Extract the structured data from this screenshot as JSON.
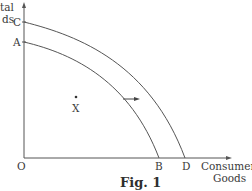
{
  "diagram": {
    "type": "production-possibility-frontier",
    "caption": "Fig. 1",
    "y_axis": {
      "label_line1": "Capital",
      "label_line2": "Goods",
      "visible_line1": "tal",
      "visible_line2": "ds"
    },
    "x_axis": {
      "label_line1": "Consumer",
      "label_line2": "Goods"
    },
    "origin_label": "O",
    "points": {
      "A": "A",
      "B": "B",
      "C": "C",
      "D": "D",
      "X": "X"
    },
    "curves": [
      {
        "name": "AB",
        "from": "A",
        "to": "B",
        "description": "original PPF"
      },
      {
        "name": "CD",
        "from": "C",
        "to": "D",
        "description": "shifted-out PPF"
      }
    ],
    "shift_arrow": {
      "direction": "right",
      "meaning": "outward shift of PPF from AB to CD"
    },
    "colors": {
      "line": "#555555",
      "text": "#3a3a3a",
      "background": "#ffffff"
    }
  }
}
